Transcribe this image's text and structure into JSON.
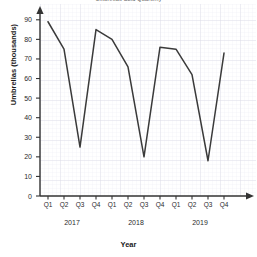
{
  "chart_data": {
    "type": "line",
    "title": "Umbrellas Sold Quarterly",
    "xlabel": "Year",
    "ylabel": "Umbrellas (thousands)",
    "ylim": [
      0,
      95
    ],
    "yticks": [
      0,
      10,
      20,
      30,
      40,
      50,
      60,
      70,
      80,
      90
    ],
    "grid": true,
    "legend": "none",
    "line_color": "#3a3a3a",
    "grid_color": "#dcdce4",
    "grid_minor_color": "#ebebf2",
    "axis_color": "#333333",
    "categories": [
      "Q1",
      "Q2",
      "Q3",
      "Q4",
      "Q1",
      "Q2",
      "Q3",
      "Q4",
      "Q1",
      "Q2",
      "Q3",
      "Q4"
    ],
    "group_labels": [
      "2017",
      "2018",
      "2019"
    ],
    "values": [
      89,
      75,
      25,
      85,
      80,
      66,
      20,
      76,
      75,
      62,
      18,
      73
    ],
    "series": [
      {
        "name": "Umbrellas sold",
        "points": [
          {
            "x": "Q1 2017",
            "y": 89
          },
          {
            "x": "Q2 2017",
            "y": 75
          },
          {
            "x": "Q3 2017",
            "y": 25
          },
          {
            "x": "Q4 2017",
            "y": 85
          },
          {
            "x": "Q1 2018",
            "y": 80
          },
          {
            "x": "Q2 2018",
            "y": 66
          },
          {
            "x": "Q3 2018",
            "y": 20
          },
          {
            "x": "Q4 2018",
            "y": 76
          },
          {
            "x": "Q1 2019",
            "y": 75
          },
          {
            "x": "Q2 2019",
            "y": 62
          },
          {
            "x": "Q3 2019",
            "y": 18
          },
          {
            "x": "Q4 2019",
            "y": 73
          }
        ]
      }
    ]
  }
}
